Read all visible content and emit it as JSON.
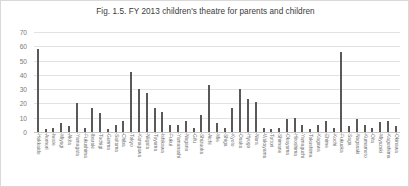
{
  "chart_data": {
    "type": "bar",
    "title": "Fig. 1.5. FY 2013 children's theatre for parents and children",
    "xlabel": "",
    "ylabel": "",
    "ylim": [
      0,
      70
    ],
    "yticks": [
      0,
      10,
      20,
      30,
      40,
      50,
      60,
      70
    ],
    "grid": true,
    "legend": false,
    "bar_color": "#595959",
    "grid_color": "#e2e2e2",
    "categories": [
      "Hokkaido",
      "Aomori",
      "Iwate",
      "Miyagi",
      "Akita",
      "Yamagata",
      "Fukushima",
      "Ibaraki",
      "Tochigi",
      "Gunma",
      "Saitama",
      "Chiba",
      "Tokyo",
      "Kanagawa",
      "Niigata",
      "Toyama",
      "Ishikawa",
      "Fukui",
      "Yamanashi",
      "Nagano",
      "Gifu",
      "Shizuoka",
      "Aichi",
      "Mie",
      "Shiga",
      "Kyoto",
      "Osaka",
      "Hyogo",
      "Nara",
      "Wakayama",
      "Tottori",
      "Shimane",
      "Okayama",
      "Hiroshima",
      "Yamaguchi",
      "Tokushima",
      "Kagawa",
      "Ehime",
      "Kochi",
      "Fukuoka",
      "Saga",
      "Nagasaki",
      "Kumamoto",
      "Oita",
      "Miyazaki",
      "Kagoshima",
      "Okinawa"
    ],
    "values": [
      58,
      2,
      3,
      6,
      4,
      20,
      3,
      17,
      13,
      2,
      5,
      8,
      42,
      30,
      27,
      17,
      14,
      5,
      5,
      8,
      3,
      12,
      33,
      6,
      3,
      17,
      30,
      23,
      21,
      3,
      2,
      3,
      9,
      10,
      5,
      2,
      5,
      8,
      3,
      56,
      4,
      9,
      5,
      3,
      7,
      8,
      4
    ]
  }
}
